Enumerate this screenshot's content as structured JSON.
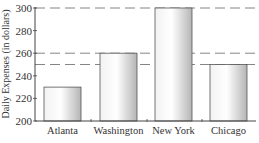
{
  "chart_data": {
    "type": "bar",
    "title": "",
    "xlabel": "",
    "ylabel": "Daily Expenses (in dollars)",
    "categories": [
      "Atlanta",
      "Washington",
      "New York",
      "Chicago"
    ],
    "values": [
      230,
      260,
      300,
      250
    ],
    "ylim": [
      200,
      300
    ],
    "yticks": [
      200,
      220,
      240,
      260,
      280,
      300
    ],
    "reference_lines": [
      300,
      260,
      250
    ],
    "grid": false,
    "legend": null
  },
  "colors": {
    "axis": "#444444",
    "bar_edge": "#555555",
    "bar_light": "#fafafa",
    "bar_dark": "#b8b8b8",
    "dash": "#666666",
    "text": "#333333"
  }
}
